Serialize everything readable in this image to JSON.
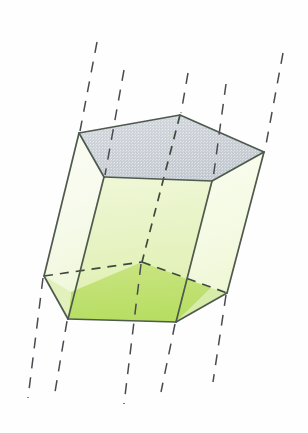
{
  "figure": {
    "background_color": "#fefefe",
    "canvas": {
      "width": 308,
      "height": 433
    }
  },
  "palette": {
    "edge_visible": "#4f5a4e",
    "edge_hidden": "#3f4a3f",
    "guide_line": "#4a4a52",
    "top_face_fill": "#c9ced4",
    "top_face_fill_light": "#d7dbe0",
    "front_face_light": "#f2f7dc",
    "front_face_mid": "#e4f0bc",
    "front_face_dark": "#bde06a",
    "side_face_pale": "#f7fae9",
    "side_face_paler": "#fbfdf4"
  },
  "geometry": {
    "top_face": {
      "name": "top-pentagon",
      "fill": "#c9ced4",
      "points": "79,133 180,115 264,152 212,181 104,177"
    },
    "bottom_face": {
      "name": "bottom-pentagon",
      "points": "44,276 142,262 227,293 176,322 68,319"
    },
    "faces": [
      {
        "name": "left-lateral-face",
        "points": "79,133 104,177 68,319 44,276",
        "fill": "#f9fcef"
      },
      {
        "name": "front-left-lateral-face",
        "points": "104,177 212,181 176,322 68,319",
        "fill": "#eaf4c8"
      },
      {
        "name": "right-lateral-face",
        "points": "212,181 264,152 227,293 176,322",
        "fill": "#f5fae4"
      }
    ],
    "front_lower_shade": {
      "name": "front-face-lower-shade",
      "points": "72,294 142,262 210,288 176,322 68,319",
      "fill": "#bfe173"
    },
    "visible_edges": [
      {
        "name": "top-edge-back-left",
        "d": "M79,133 L180,115"
      },
      {
        "name": "top-edge-back-right",
        "d": "M180,115 L264,152"
      },
      {
        "name": "top-edge-front-right",
        "d": "M264,152 L212,181"
      },
      {
        "name": "top-edge-front",
        "d": "M212,181 L104,177"
      },
      {
        "name": "top-edge-front-left",
        "d": "M104,177 L79,133"
      },
      {
        "name": "lateral-edge-far-left",
        "d": "M79,133 L44,276"
      },
      {
        "name": "lateral-edge-front-left",
        "d": "M104,177 L68,319"
      },
      {
        "name": "lateral-edge-front-right",
        "d": "M212,181 L176,322"
      },
      {
        "name": "lateral-edge-far-right",
        "d": "M264,152 L227,293"
      },
      {
        "name": "bottom-edge-front-left",
        "d": "M44,276 L68,319"
      },
      {
        "name": "bottom-edge-front",
        "d": "M68,319 L176,322"
      },
      {
        "name": "bottom-edge-front-right",
        "d": "M176,322 L227,293"
      }
    ],
    "hidden_edges": [
      {
        "name": "bottom-edge-back-left",
        "d": "M44,276 L142,262"
      },
      {
        "name": "bottom-edge-back-right",
        "d": "M142,262 L227,293"
      },
      {
        "name": "lateral-edge-hidden-back",
        "d": "M180,115 L142,262"
      }
    ],
    "guide_lines": [
      {
        "name": "guide-line-1",
        "d": "M97,42 L79,133",
        "label": "extension above far-left edge"
      },
      {
        "name": "guide-line-2",
        "d": "M124,70 L104,177",
        "label": "extension above front-left edge"
      },
      {
        "name": "guide-line-3",
        "d": "M188,73 L180,115",
        "label": "extension above back apex edge"
      },
      {
        "name": "guide-line-4",
        "d": "M226,84 L212,181",
        "label": "extension above front-right edge"
      },
      {
        "name": "guide-line-5",
        "d": "M283,53 L264,152",
        "label": "extension above far-right edge"
      },
      {
        "name": "guide-line-6",
        "d": "M44,276 L28,398",
        "label": "extension below far-left edge"
      },
      {
        "name": "guide-line-7",
        "d": "M68,319 L55,392",
        "label": "extension below front-left edge"
      },
      {
        "name": "guide-line-8",
        "d": "M142,262 L124,404",
        "label": "extension below back apex edge"
      },
      {
        "name": "guide-line-9",
        "d": "M176,322 L161,392",
        "label": "extension below front-right edge"
      },
      {
        "name": "guide-line-10",
        "d": "M227,293 L213,382",
        "label": "extension below far-right edge"
      }
    ]
  }
}
